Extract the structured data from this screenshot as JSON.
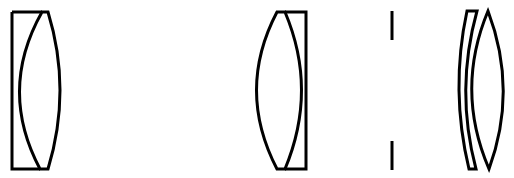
{
  "diagram": {
    "title": "Optical lens system schematic",
    "colors": {
      "background": "#ffffff",
      "stroke": "#000000"
    },
    "elements": [
      {
        "id": "element-1",
        "type": "plano-convex doublet (plate + biconvex lens)",
        "label": "Doublet 1"
      },
      {
        "id": "element-2",
        "type": "biconvex lens + plate doublet",
        "label": "Doublet 2"
      },
      {
        "id": "stop",
        "type": "aperture stop",
        "label": "Aperture stop"
      },
      {
        "id": "element-3",
        "type": "meniscus lens",
        "label": "Meniscus"
      },
      {
        "id": "element-4",
        "type": "biconvex lens",
        "label": "Biconvex lens"
      }
    ]
  }
}
